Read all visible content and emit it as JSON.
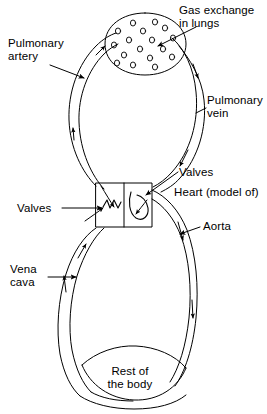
{
  "diagram": {
    "background_color": "#ffffff",
    "line_color": "#000000",
    "labels": {
      "pulmonary_artery": "Pulmonary\nartery",
      "gas_exchange": "Gas exchange\nin lungs",
      "pulmonary_vein": "Pulmonary\nvein",
      "valves_right": "Valves",
      "heart": "Heart (model of)",
      "aorta": "Aorta",
      "valves_left": "Valves",
      "vena_cava": "Vena\ncava",
      "rest_of_body": "Rest of\nthe body"
    },
    "structures": [
      {
        "name": "lungs",
        "shape": "oval",
        "contains": "alveoli-circles",
        "alveoli_count": 17
      },
      {
        "name": "heart",
        "shape": "rectangle",
        "chambers": 2,
        "note": "model of"
      },
      {
        "name": "rest-of-body",
        "shape": "lens"
      }
    ],
    "vessels": [
      {
        "name": "pulmonary-artery",
        "side": "left-upper",
        "flow_direction": "up-to-lungs"
      },
      {
        "name": "pulmonary-vein",
        "side": "right-upper",
        "flow_direction": "down-to-heart"
      },
      {
        "name": "aorta",
        "side": "right-lower",
        "flow_direction": "down-to-body"
      },
      {
        "name": "vena-cava",
        "side": "left-lower",
        "flow_direction": "up-to-heart"
      }
    ]
  }
}
